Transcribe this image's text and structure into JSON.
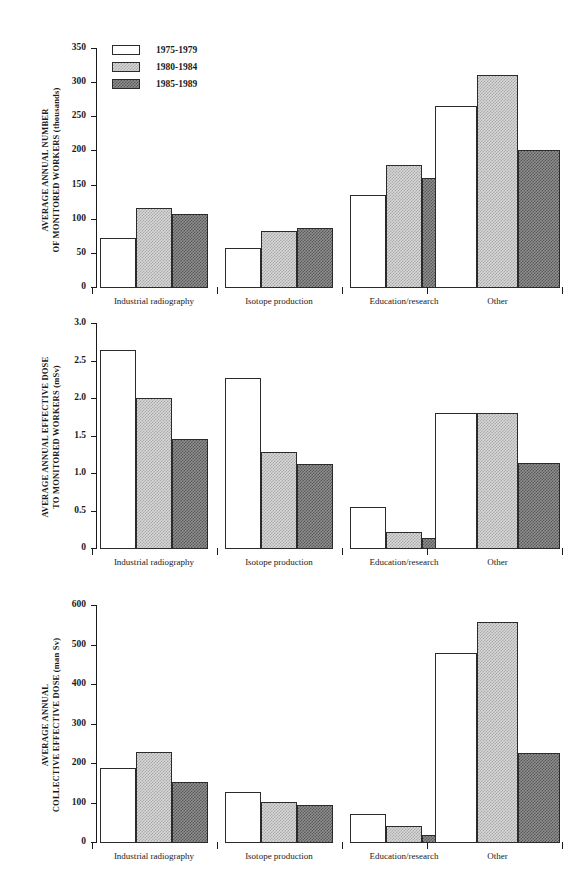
{
  "figure": {
    "legend": {
      "entries": [
        {
          "label": "1975-1979",
          "swatch": "white-open-box",
          "color": "#ffffff"
        },
        {
          "label": "1980-1984",
          "swatch": "light-dotted-box",
          "color": "#d8d8d8"
        },
        {
          "label": "1985-1989",
          "swatch": "dark-dotted-box",
          "color": "#8e8e8e"
        }
      ]
    },
    "categories": [
      "Industrial radiography",
      "Isotope production",
      "Education/research",
      "Other"
    ]
  },
  "chart_data": [
    {
      "type": "bar",
      "panel": 1,
      "title": "",
      "ylabel": "AVERAGE ANNUAL NUMBER OF MONITORED WORKERS (thousands)",
      "ylabel_lines": [
        "AVERAGE ANNUAL NUMBER",
        "OF MONITORED WORKERS  (thousands)"
      ],
      "xlabel": "",
      "ylim": [
        0,
        350
      ],
      "yticks": [
        0,
        50,
        100,
        150,
        200,
        250,
        300,
        350
      ],
      "ytick_labels": [
        "0",
        "50",
        "100",
        "150",
        "200",
        "250",
        "300",
        "350"
      ],
      "grid": false,
      "legend_position": "top-left",
      "categories": [
        "Industrial radiography",
        "Isotope production",
        "Education/research",
        "Other"
      ],
      "series": [
        {
          "name": "1975-1979",
          "values": [
            72,
            57,
            134,
            265
          ]
        },
        {
          "name": "1980-1984",
          "values": [
            115,
            82,
            179,
            310
          ]
        },
        {
          "name": "1985-1989",
          "values": [
            107,
            87,
            160,
            200
          ]
        }
      ]
    },
    {
      "type": "bar",
      "panel": 2,
      "title": "",
      "ylabel": "AVERAGE ANNUAL EFFECTIVE DOSE TO MONITORED WORKERS (mSv)",
      "ylabel_lines": [
        "AVERAGE ANNUAL EFFECTIVE DOSE",
        "TO MONITORED WORKERS  (mSv)"
      ],
      "xlabel": "",
      "ylim": [
        0,
        3.0
      ],
      "yticks": [
        0,
        0.5,
        1.0,
        1.5,
        2.0,
        2.5,
        3.0
      ],
      "ytick_labels": [
        "0",
        "0.5",
        "1.0",
        "1.5",
        "2.0",
        "2.5",
        "3.0"
      ],
      "grid": false,
      "legend_position": "none",
      "categories": [
        "Industrial radiography",
        "Isotope production",
        "Education/research",
        "Other"
      ],
      "series": [
        {
          "name": "1975-1979",
          "values": [
            2.64,
            2.27,
            0.55,
            1.8
          ]
        },
        {
          "name": "1980-1984",
          "values": [
            2.0,
            1.28,
            0.22,
            1.8
          ]
        },
        {
          "name": "1985-1989",
          "values": [
            1.45,
            1.12,
            0.13,
            1.13
          ]
        }
      ]
    },
    {
      "type": "bar",
      "panel": 3,
      "title": "",
      "ylabel": "AVERAGE ANNUAL COLLECTIVE EFFECTIVE DOSE (man Sv)",
      "ylabel_lines": [
        "AVERAGE ANNUAL",
        "COLLECTIVE EFFECTIVE DOSE  (man Sv)"
      ],
      "xlabel": "",
      "ylim": [
        0,
        600
      ],
      "yticks": [
        0,
        100,
        200,
        300,
        400,
        500,
        600
      ],
      "ytick_labels": [
        "0",
        "100",
        "200",
        "300",
        "400",
        "500",
        "600"
      ],
      "grid": false,
      "legend_position": "none",
      "categories": [
        "Industrial radiography",
        "Isotope production",
        "Education/research",
        "Other"
      ],
      "series": [
        {
          "name": "1975-1979",
          "values": [
            187,
            126,
            70,
            478
          ]
        },
        {
          "name": "1980-1984",
          "values": [
            228,
            101,
            40,
            558
          ]
        },
        {
          "name": "1985-1989",
          "values": [
            153,
            94,
            18,
            225
          ]
        }
      ]
    }
  ]
}
